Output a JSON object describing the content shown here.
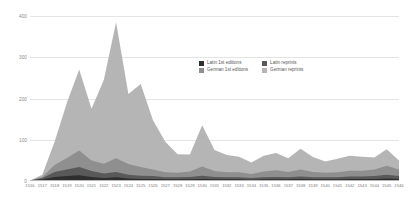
{
  "chart_data": {
    "type": "area",
    "stacked": true,
    "title": "",
    "subtitle": "",
    "xlabel": "",
    "ylabel": "",
    "ylim": [
      0,
      400
    ],
    "yticks": [
      0,
      100,
      200,
      300,
      400
    ],
    "grid": true,
    "legend_position": "upper-right-inside",
    "categories": [
      "1516",
      "1517",
      "1518",
      "1519",
      "1520",
      "1521",
      "1522",
      "1523",
      "1524",
      "1525",
      "1526",
      "1527",
      "1528",
      "1529",
      "1530",
      "1531",
      "1532",
      "1533",
      "1534",
      "1535",
      "1536",
      "1537",
      "1538",
      "1539",
      "1540",
      "1541",
      "1542",
      "1543",
      "1544",
      "1545",
      "1546"
    ],
    "series": [
      {
        "name": "Latin 1st editions",
        "color": "#2e2e2e",
        "values": [
          1,
          4,
          10,
          12,
          14,
          10,
          7,
          9,
          6,
          5,
          5,
          4,
          4,
          4,
          5,
          4,
          4,
          4,
          3,
          4,
          4,
          4,
          5,
          4,
          4,
          4,
          5,
          5,
          5,
          6,
          5
        ]
      },
      {
        "name": "Latin reprints",
        "color": "#595959",
        "values": [
          0,
          3,
          12,
          16,
          20,
          14,
          11,
          13,
          9,
          8,
          7,
          5,
          5,
          6,
          8,
          6,
          5,
          5,
          4,
          5,
          6,
          5,
          6,
          5,
          5,
          5,
          6,
          6,
          7,
          9,
          7
        ]
      },
      {
        "name": "German 1st editions",
        "color": "#8f8f8f",
        "values": [
          0,
          3,
          17,
          28,
          40,
          26,
          24,
          33,
          26,
          21,
          16,
          12,
          11,
          13,
          22,
          14,
          12,
          12,
          10,
          14,
          16,
          13,
          17,
          13,
          11,
          12,
          14,
          14,
          16,
          22,
          16
        ]
      },
      {
        "name": "German reprints",
        "color": "#b5b5b5",
        "values": [
          0,
          5,
          56,
          134,
          196,
          125,
          203,
          330,
          170,
          201,
          119,
          74,
          45,
          41,
          100,
          51,
          42,
          38,
          28,
          38,
          42,
          33,
          50,
          36,
          27,
          33,
          36,
          34,
          29,
          40,
          22
        ]
      }
    ],
    "legend": [
      "Latin 1st editions",
      "Latin reprints",
      "German 1st editions",
      "German reprints"
    ],
    "colors": {
      "latin_first_editions": "#2e2e2e",
      "latin_reprints": "#595959",
      "german_first_editions": "#8f8f8f",
      "german_reprints": "#b5b5b5",
      "gridline": "#e4e4e4",
      "axis": "#b8b8b8",
      "tick_label": "#8a8a8a",
      "background": "#ffffff"
    }
  }
}
